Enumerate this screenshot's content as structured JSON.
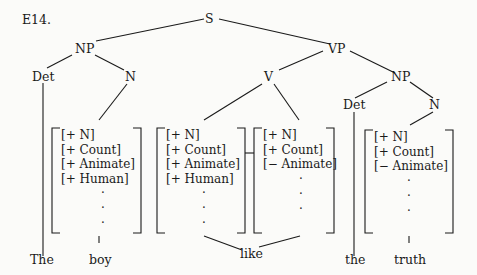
{
  "example_label": "E14.",
  "nodes": {
    "S": "S",
    "NP1": "NP",
    "Det1": "Det",
    "N1": "N",
    "VP": "VP",
    "V": "V",
    "NP2": "NP",
    "Det2": "Det",
    "N2": "N"
  },
  "feature_sets": [
    {
      "features": [
        "[+ N]",
        "[+ Count]",
        "[+ Animate]",
        "[+ Human]"
      ],
      "dots": [
        "·",
        "·",
        "·"
      ]
    },
    {
      "features": [
        "[+ N]",
        "[+ Count]",
        "[+ Animate]",
        "[+ Human]"
      ],
      "dots": [
        "·",
        "·",
        "·"
      ]
    },
    {
      "features": [
        "[+ N]",
        "[+ Count]",
        "[− Animate]"
      ],
      "dots": [
        "·",
        "·",
        "·"
      ]
    },
    {
      "features": [
        "[+ N]",
        "[+ Count]",
        "[− Animate]"
      ],
      "dots": [
        "·",
        "·",
        "·"
      ]
    }
  ],
  "words": {
    "w1": "The",
    "w2": "boy",
    "w3": "like",
    "w4": "the",
    "w5": "truth"
  }
}
